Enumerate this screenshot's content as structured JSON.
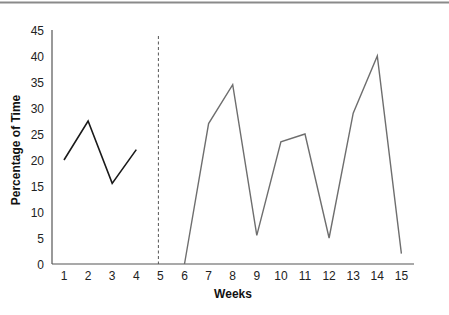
{
  "chart_data": {
    "type": "line",
    "title": "",
    "xlabel": "Weeks",
    "ylabel": "Percentage of Time",
    "ylim": [
      0,
      45
    ],
    "yticks": [
      0,
      5,
      10,
      15,
      20,
      25,
      30,
      35,
      40,
      45
    ],
    "xlim": [
      1,
      15
    ],
    "xticks": [
      1,
      2,
      3,
      4,
      5,
      6,
      7,
      8,
      9,
      10,
      11,
      12,
      13,
      14,
      15
    ],
    "grid": false,
    "legend": null,
    "phase_change_line": {
      "x": 5,
      "style": "dashed",
      "color": "#555555"
    },
    "series": [
      {
        "name": "Phase 1",
        "color": "#1a1a1a",
        "x": [
          1,
          2,
          3,
          4
        ],
        "values": [
          20,
          27.5,
          15.5,
          22
        ]
      },
      {
        "name": "Phase 2",
        "color": "#6e6e6e",
        "x": [
          6,
          7,
          8,
          9,
          10,
          11,
          12,
          13,
          14,
          15
        ],
        "values": [
          0,
          27,
          34.5,
          5.5,
          23.5,
          25,
          5,
          29,
          40,
          2
        ]
      }
    ]
  },
  "colors": {
    "axis": "#555555",
    "top_rule": "#8a8a8a"
  }
}
